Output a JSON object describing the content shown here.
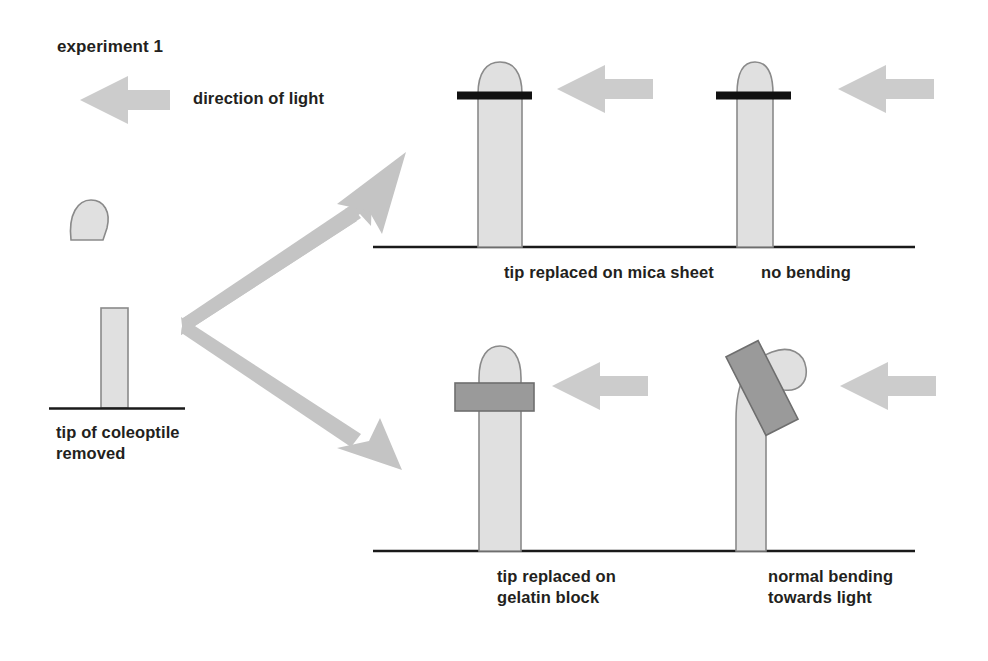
{
  "figure": {
    "title": "experiment 1",
    "direction_of_light_label": "direction of light",
    "background_color": "#ffffff",
    "text_color": "#231f20"
  },
  "colors": {
    "coleoptile_fill": "#e0e0e0",
    "coleoptile_stroke": "#8a8a8a",
    "gelatin_block_fill": "#9a9a9a",
    "gelatin_block_stroke": "#6e6e6e",
    "mica_sheet_fill": "#111111",
    "light_arrow_fill": "#cccccc",
    "branch_arrow_fill": "#c4c4c4",
    "ground_line": "#1a1a1a"
  },
  "left_column": {
    "severed_tip": {
      "name": "severed coleoptile tip",
      "shape": "dome"
    },
    "stump": {
      "name": "decapitated coleoptile stump",
      "shape": "rectangle"
    },
    "caption": "tip of coleoptile\nremoved"
  },
  "branch_arrows": [
    {
      "name": "branch-arrow-upper",
      "direction": "up-right"
    },
    {
      "name": "branch-arrow-lower",
      "direction": "down-right"
    }
  ],
  "panels": [
    {
      "id": "mica",
      "caption": "tip replaced on mica sheet",
      "barrier": "mica sheet",
      "barrier_type": "mica",
      "outcome": "no bending",
      "stem": "straight",
      "light_arrow": true
    },
    {
      "id": "no-bending",
      "caption": "no bending",
      "barrier": "mica sheet",
      "barrier_type": "mica",
      "outcome": "no bending",
      "stem": "straight",
      "light_arrow": true
    },
    {
      "id": "gelatin",
      "caption": "tip replaced on\ngelatin block",
      "barrier": "gelatin block",
      "barrier_type": "gelatin",
      "outcome": "bends towards light",
      "stem": "straight",
      "light_arrow": true
    },
    {
      "id": "normal-bending",
      "caption": "normal bending\ntowards light",
      "barrier": "gelatin block",
      "barrier_type": "gelatin",
      "outcome": "bends towards light",
      "stem": "curved",
      "light_arrow": true
    }
  ]
}
